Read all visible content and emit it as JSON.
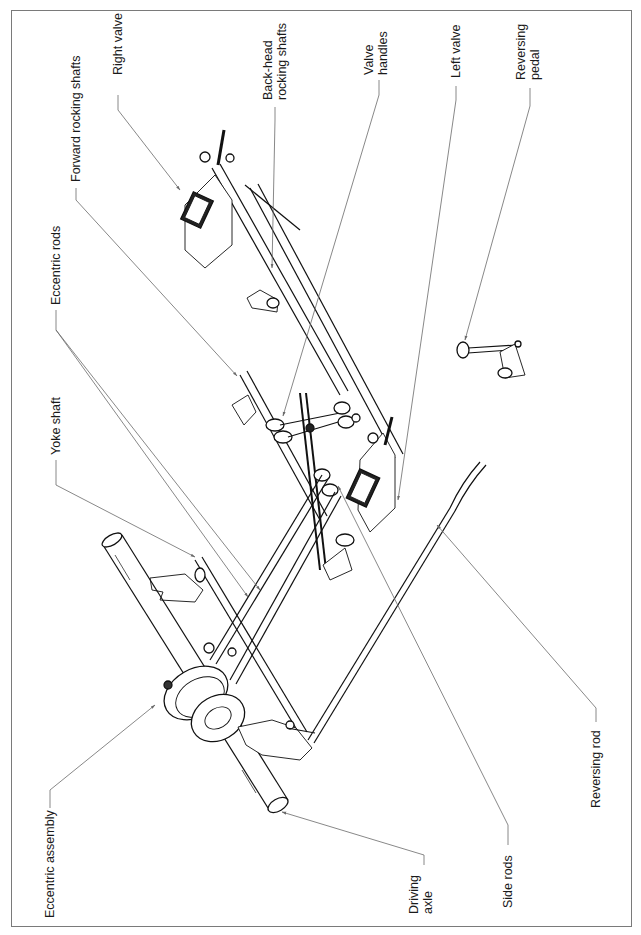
{
  "figure": {
    "type": "exploded technical illustration",
    "orientation": "rotated 90° counter-clockwise (labels read bottom-to-top)",
    "border_color": "#7a7a7a",
    "line_color": "#111111",
    "leader_color": "#6a6a6a"
  },
  "labels": {
    "right_valve": "Right valve",
    "forward_rocking_shafts": "Forward rocking shafts",
    "back_head_rocking_shafts_1": "Back-head",
    "back_head_rocking_shafts_2": "rocking shafts",
    "eccentric_rods": "Eccentric rods",
    "valve_handles_1": "Valve",
    "valve_handles_2": "handles",
    "left_valve": "Left valve",
    "reversing_pedal_1": "Reversing",
    "reversing_pedal_2": "pedal",
    "yoke_shaft": "Yoke shaft",
    "eccentric_assembly": "Eccentric assembly",
    "driving_axle_1": "Driving",
    "driving_axle_2": "axle",
    "side_rods": "Side rods",
    "reversing_rod": "Reversing rod"
  },
  "components": [
    "Right valve",
    "Forward rocking shafts",
    "Back-head rocking shafts",
    "Eccentric rods",
    "Valve handles",
    "Left valve",
    "Reversing pedal",
    "Yoke shaft",
    "Eccentric assembly",
    "Driving axle",
    "Side rods",
    "Reversing rod"
  ]
}
